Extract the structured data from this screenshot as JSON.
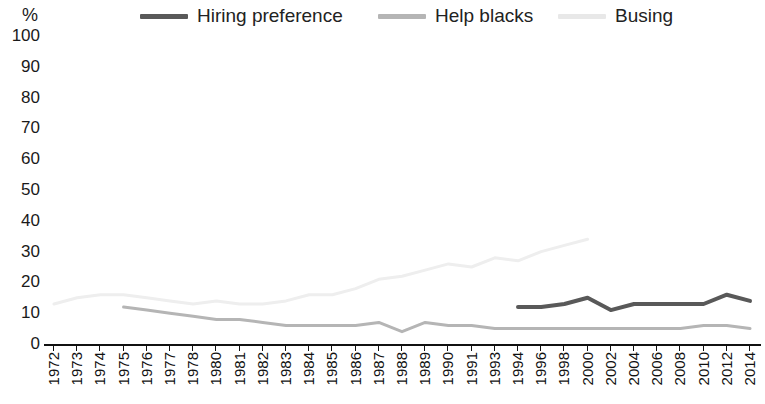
{
  "axis": {
    "y_unit_label": "%",
    "y_ticks": [
      "100",
      "90",
      "80",
      "70",
      "60",
      "50",
      "40",
      "30",
      "20",
      "10",
      "0"
    ]
  },
  "legend": {
    "items": [
      {
        "label": "Hiring preference",
        "color": "#595959",
        "name": "hiring-preference"
      },
      {
        "label": "Help blacks",
        "color": "#b5b5b5",
        "name": "help-blacks"
      },
      {
        "label": "Busing",
        "color": "#e8e8e8",
        "name": "busing"
      }
    ]
  },
  "chart_data": {
    "type": "line",
    "title": "",
    "subtitle": "",
    "xlabel": "",
    "ylabel": "%",
    "ylim": [
      0,
      100
    ],
    "ytick_step": 10,
    "grid": false,
    "legend_position": "top",
    "categories": [
      "1972",
      "1973",
      "1974",
      "1975",
      "1976",
      "1977",
      "1978",
      "1980",
      "1981",
      "1982",
      "1983",
      "1984",
      "1985",
      "1986",
      "1987",
      "1988",
      "1989",
      "1990",
      "1991",
      "1993",
      "1994",
      "1996",
      "1998",
      "2000",
      "2002",
      "2004",
      "2006",
      "2008",
      "2010",
      "2012",
      "2014"
    ],
    "series": [
      {
        "name": "Hiring preference",
        "color": "#595959",
        "width": 4,
        "values": [
          null,
          null,
          null,
          null,
          null,
          null,
          null,
          null,
          null,
          null,
          null,
          null,
          null,
          null,
          null,
          null,
          null,
          null,
          null,
          null,
          12,
          12,
          13,
          15,
          11,
          13,
          13,
          13,
          13,
          16,
          14
        ]
      },
      {
        "name": "Help blacks",
        "color": "#b5b5b5",
        "width": 3,
        "values": [
          null,
          null,
          null,
          12,
          11,
          10,
          9,
          8,
          8,
          7,
          6,
          6,
          6,
          6,
          7,
          4,
          7,
          6,
          6,
          5,
          5,
          5,
          5,
          5,
          5,
          5,
          5,
          5,
          6,
          6,
          5
        ]
      },
      {
        "name": "Busing",
        "color": "#eeeeee",
        "width": 3,
        "values": [
          13,
          15,
          16,
          16,
          15,
          14,
          13,
          14,
          13,
          13,
          14,
          16,
          16,
          18,
          21,
          22,
          24,
          26,
          25,
          28,
          27,
          30,
          32,
          34,
          null,
          null,
          null,
          null,
          null,
          null,
          null
        ]
      }
    ]
  }
}
